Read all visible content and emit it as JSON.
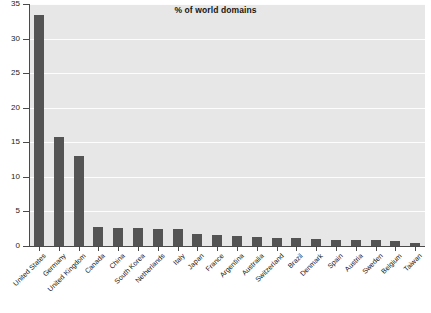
{
  "chart": {
    "title": "% of world domains",
    "y_axis": {
      "ticks": [
        "0",
        "5",
        "10",
        "15",
        "20",
        "25",
        "30",
        "35"
      ]
    }
  },
  "chart_data": {
    "type": "bar",
    "title": "% of world domains",
    "xlabel": "",
    "ylabel": "",
    "ylim": [
      0,
      35
    ],
    "ytick_step": 5,
    "grid": true,
    "legend": "none",
    "bar_color": "#545454",
    "plot_background": "#e7e7e7",
    "gridline_color": "#ffffff",
    "categories": [
      "United States",
      "Germany",
      "United Kingdom",
      "Canada",
      "China",
      "South Korea",
      "Netherlands",
      "Italy",
      "Japan",
      "France",
      "Argentina",
      "Australia",
      "Switzerland",
      "Brazil",
      "Denmark",
      "Spain",
      "Austria",
      "Sweden",
      "Belgium",
      "Taiwan"
    ],
    "values": [
      33.4,
      15.8,
      13.0,
      2.7,
      2.6,
      2.6,
      2.5,
      2.4,
      1.7,
      1.6,
      1.4,
      1.3,
      1.2,
      1.1,
      1.0,
      0.9,
      0.8,
      0.8,
      0.7,
      0.5
    ]
  }
}
